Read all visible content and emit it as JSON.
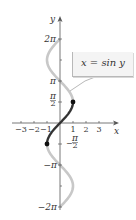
{
  "chart_data": {
    "type": "line",
    "title": "",
    "xlabel": "x",
    "ylabel": "y",
    "annotation": "x = sin y",
    "x_ticks": [
      "−3",
      "−2",
      "−1",
      "1",
      "2",
      "3"
    ],
    "x_tick_values": [
      -3,
      -2,
      -1,
      1,
      2,
      3
    ],
    "y_ticks": [
      "2π",
      "π",
      "π/2",
      "−π/2",
      "−π",
      "−2π"
    ],
    "y_tick_values": [
      6.2832,
      3.1416,
      1.5708,
      -1.5708,
      -3.1416,
      -6.2832
    ],
    "xlim": [
      -3.5,
      4.5
    ],
    "ylim": [
      -6.6,
      8.0
    ],
    "grid": false,
    "series": [
      {
        "name": "x = sin y (full curve)",
        "color": "#c8c8c8",
        "y_range": [
          -6.2832,
          6.2832
        ],
        "points": [
          {
            "y": -6.2832,
            "x": 0
          },
          {
            "y": -4.7124,
            "x": 1
          },
          {
            "y": -3.1416,
            "x": 0
          },
          {
            "y": -1.5708,
            "x": -1
          },
          {
            "y": 0,
            "x": 0
          },
          {
            "y": 1.5708,
            "x": 1
          },
          {
            "y": 3.1416,
            "x": 0
          },
          {
            "y": 4.7124,
            "x": -1
          },
          {
            "y": 6.2832,
            "x": 0
          }
        ]
      },
      {
        "name": "restricted x = sin y, −π/2 ≤ y ≤ π/2",
        "color": "#333333",
        "y_range": [
          -1.5708,
          1.5708
        ],
        "points": [
          {
            "y": -1.5708,
            "x": -1
          },
          {
            "y": 0,
            "x": 0
          },
          {
            "y": 1.5708,
            "x": 1
          }
        ],
        "endpoints": [
          {
            "x": -1,
            "y": -1.5708
          },
          {
            "x": 1,
            "y": 1.5708
          }
        ]
      }
    ]
  },
  "labels": {
    "x_axis": "x",
    "y_axis": "y",
    "legend": "x = sin y",
    "xt": [
      "−3",
      "−2",
      "−1",
      "1",
      "2",
      "3"
    ],
    "y_2pi": "2π",
    "y_pi": "π",
    "y_pi2_num": "π",
    "y_pi2_den": "2",
    "y_npi2_minus": "−",
    "y_npi2_num": "π",
    "y_npi2_den": "2",
    "y_npi": "−π",
    "y_n2pi": "−2π"
  },
  "colors": {
    "axis": "#555555",
    "curve_light": "#c8c8c8",
    "curve_dark": "#333333"
  }
}
